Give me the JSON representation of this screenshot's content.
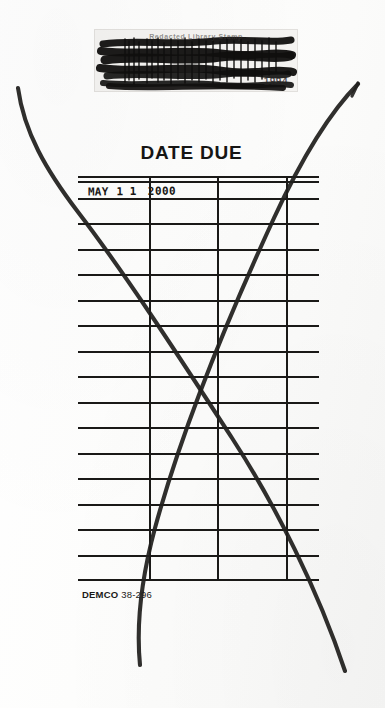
{
  "document": {
    "kind": "library-date-due-slip",
    "title": "DATE DUE"
  },
  "redaction": {
    "faint_text": "Redacted Library Stamp",
    "year_fragment": "1994",
    "note": "scribbled-out ownership stamp"
  },
  "grid": {
    "columns": 4,
    "rows": 16,
    "column_divider_x": [
      72,
      140,
      209
    ],
    "row_height": 25.5
  },
  "stamp": {
    "month": "MAY",
    "day_digit_1": "1",
    "day_digit_2": "1",
    "year": "2000",
    "full": "MAY 11 2000"
  },
  "imprint": {
    "brand": "DEMCO",
    "code": " 38-296"
  },
  "annotations": {
    "stroke_1_name": "descending-pen-stroke",
    "stroke_2_name": "ascending-pen-stroke"
  },
  "colors": {
    "ink": "#161514",
    "paper": "#fdfdfc",
    "rule": "#1a1917",
    "pen": "#201f1d"
  }
}
